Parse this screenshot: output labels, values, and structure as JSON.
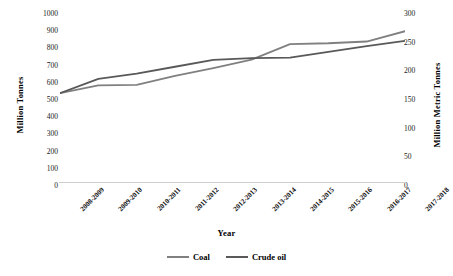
{
  "chart_data": {
    "type": "line",
    "title": "",
    "xlabel": "Year",
    "ylabel": "Million Tonnes",
    "y2label": "Million Metric Tonnes",
    "grid": false,
    "legend_position": "bottom",
    "categories": [
      "2008-2009",
      "2009-2010",
      "2010-2011",
      "2011-2012",
      "2012-2013",
      "2013-2014",
      "2014-2015",
      "2015-2016",
      "2016-2017",
      "2017-2018"
    ],
    "ylim": [
      0,
      1000
    ],
    "yticks": [
      0,
      100,
      200,
      300,
      400,
      500,
      600,
      700,
      800,
      900,
      1000
    ],
    "y2lim": [
      0,
      300
    ],
    "y2ticks": [
      0,
      50,
      100,
      150,
      200,
      250,
      300
    ],
    "series": [
      {
        "name": "Coal",
        "axis": "left",
        "color": "#808080",
        "values": [
          540,
          585,
          588,
          640,
          685,
          735,
          825,
          830,
          840,
          900
        ]
      },
      {
        "name": "Crude oil",
        "axis": "right",
        "color": "#595959",
        "values": [
          162,
          187,
          196,
          208,
          220,
          223,
          224,
          234,
          244,
          253
        ]
      }
    ]
  },
  "legend": {
    "items": [
      {
        "label": "Coal",
        "color": "#808080"
      },
      {
        "label": "Crude oil",
        "color": "#595959"
      }
    ]
  },
  "axes": {
    "x_title": "Year",
    "y_left_title": "Million Tonnes",
    "y_right_title": "Million Metric Tonnes"
  }
}
